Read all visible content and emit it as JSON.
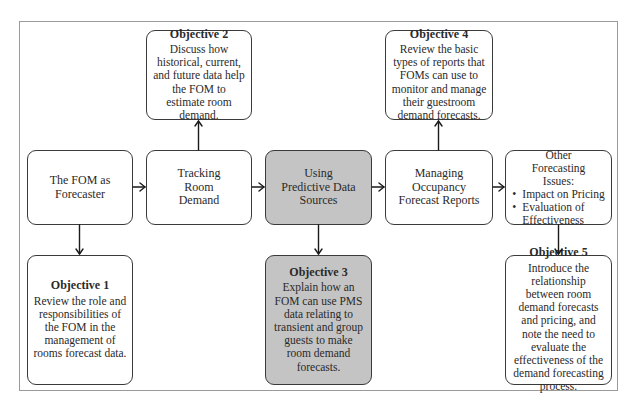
{
  "diagram": {
    "colors": {
      "box_border": "#3a3a3a",
      "highlight_fill": "#c4c4c4",
      "frame_border": "#9a9a9a",
      "arrow": "#1a1a1a"
    },
    "flow": [
      {
        "id": "fom-as-forecaster",
        "label": "The FOM as Forecaster"
      },
      {
        "id": "tracking-room-demand",
        "label": "Tracking Room Demand"
      },
      {
        "id": "using-predictive-data-sources",
        "label": "Using Predictive Data Sources",
        "highlighted": true
      },
      {
        "id": "managing-occupancy-forecast-reports",
        "label": "Managing Occupancy Forecast Reports"
      },
      {
        "id": "other-forecasting-issues",
        "label": "Other Forecasting Issues:",
        "bullets": [
          "Impact on Pricing",
          "Evaluation of Effectiveness"
        ]
      }
    ],
    "objectives": [
      {
        "title": "Objective 1",
        "text": "Review the role and responsibilities of the FOM in the management of rooms forecast data.",
        "linked_to": "fom-as-forecaster"
      },
      {
        "title": "Objective 2",
        "text": "Discuss how historical, current, and future data help the FOM to estimate room demand.",
        "linked_to": "tracking-room-demand"
      },
      {
        "title": "Objective 3",
        "text": "Explain how an FOM can use PMS data relating to transient and group guests to make room demand forecasts.",
        "linked_to": "using-predictive-data-sources",
        "highlighted": true
      },
      {
        "title": "Objective 4",
        "text": "Review the basic types of reports that FOMs can use to monitor and manage their guestroom demand forecasts.",
        "linked_to": "managing-occupancy-forecast-reports"
      },
      {
        "title": "Objective 5",
        "text": "Introduce the relationship between room demand forecasts and pricing, and note the need to evaluate the effectiveness of the demand forecasting process.",
        "linked_to": "other-forecasting-issues"
      }
    ]
  }
}
